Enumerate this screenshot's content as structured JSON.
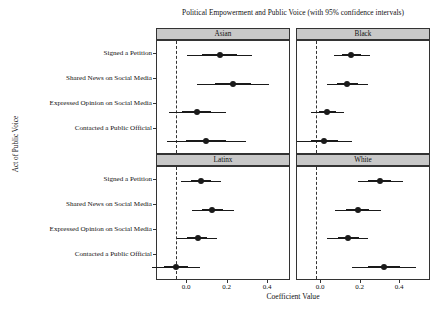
{
  "chart_data": {
    "type": "scatter",
    "title": "Political Empowerment and Public Voice (with 95% confidence intervals)",
    "xlabel": "Coefficient Value",
    "ylabel": "Act of Public Voice",
    "xlim": [
      -0.09,
      0.55
    ],
    "xticks": [
      0.0,
      0.2,
      0.4
    ],
    "xticklabels": [
      "0.0",
      "0.2",
      "0.4"
    ],
    "grid": false,
    "legend": "none",
    "reference_line": {
      "value": 0.0,
      "style": "dashed"
    },
    "categories": [
      "Signed a Petition",
      "Shared News on Social Media",
      "Expressed Opinion on Social Media",
      "Contacted a Public Official"
    ],
    "facets": [
      {
        "label": "Asian",
        "points": [
          {
            "category": "Signed a Petition",
            "estimate": 0.21,
            "ci_low": 0.055,
            "ci_high": 0.365,
            "inner_low": 0.125,
            "inner_high": 0.29
          },
          {
            "category": "Shared News on Social Media",
            "estimate": 0.275,
            "ci_low": 0.1,
            "ci_high": 0.445,
            "inner_low": 0.185,
            "inner_high": 0.36
          },
          {
            "category": "Expressed Opinion on Social Media",
            "estimate": 0.1,
            "ci_low": -0.035,
            "ci_high": 0.24,
            "inner_low": 0.03,
            "inner_high": 0.17
          },
          {
            "category": "Contacted a Public Official",
            "estimate": 0.145,
            "ci_low": -0.04,
            "ci_high": 0.335,
            "inner_low": 0.05,
            "inner_high": 0.24
          }
        ]
      },
      {
        "label": "Black",
        "points": [
          {
            "category": "Signed a Petition",
            "estimate": 0.17,
            "ci_low": 0.085,
            "ci_high": 0.26,
            "inner_low": 0.125,
            "inner_high": 0.215
          },
          {
            "category": "Shared News on Social Media",
            "estimate": 0.15,
            "ci_low": 0.055,
            "ci_high": 0.25,
            "inner_low": 0.1,
            "inner_high": 0.2
          },
          {
            "category": "Expressed Opinion on Social Media",
            "estimate": 0.055,
            "ci_low": -0.025,
            "ci_high": 0.135,
            "inner_low": 0.015,
            "inner_high": 0.095
          },
          {
            "category": "Contacted a Public Official",
            "estimate": 0.04,
            "ci_low": -0.09,
            "ci_high": 0.175,
            "inner_low": -0.025,
            "inner_high": 0.105
          }
        ]
      },
      {
        "label": "Latinx",
        "points": [
          {
            "category": "Signed a Petition",
            "estimate": 0.12,
            "ci_low": 0.025,
            "ci_high": 0.215,
            "inner_low": 0.07,
            "inner_high": 0.17
          },
          {
            "category": "Shared News on Social Media",
            "estimate": 0.175,
            "ci_low": 0.075,
            "ci_high": 0.28,
            "inner_low": 0.125,
            "inner_high": 0.225
          },
          {
            "category": "Expressed Opinion on Social Media",
            "estimate": 0.105,
            "ci_low": 0.005,
            "ci_high": 0.195,
            "inner_low": 0.055,
            "inner_high": 0.15
          },
          {
            "category": "Contacted a Public Official",
            "estimate": 0.0,
            "ci_low": -0.115,
            "ci_high": 0.115,
            "inner_low": -0.055,
            "inner_high": 0.06
          }
        ]
      },
      {
        "label": "White",
        "points": [
          {
            "category": "Signed a Petition",
            "estimate": 0.305,
            "ci_low": 0.2,
            "ci_high": 0.415,
            "inner_low": 0.25,
            "inner_high": 0.36
          },
          {
            "category": "Shared News on Social Media",
            "estimate": 0.2,
            "ci_low": 0.09,
            "ci_high": 0.31,
            "inner_low": 0.145,
            "inner_high": 0.255
          },
          {
            "category": "Expressed Opinion on Social Media",
            "estimate": 0.155,
            "ci_low": 0.055,
            "ci_high": 0.25,
            "inner_low": 0.105,
            "inner_high": 0.205
          },
          {
            "category": "Contacted a Public Official",
            "estimate": 0.325,
            "ci_low": 0.175,
            "ci_high": 0.48,
            "inner_low": 0.25,
            "inner_high": 0.4
          }
        ]
      }
    ]
  },
  "facet_labels": {
    "asian": "Asian",
    "black": "Black",
    "latinx": "Latinx",
    "white": "White"
  },
  "y_labels": {
    "r0": "Signed a Petition",
    "r1": "Shared News on Social Media",
    "r2": "Expressed Opinion on Social Media",
    "r3": "Contacted a Public Official"
  },
  "x_tick_labels": {
    "t0": "0.0",
    "t1": "0.2",
    "t2": "0.4"
  }
}
